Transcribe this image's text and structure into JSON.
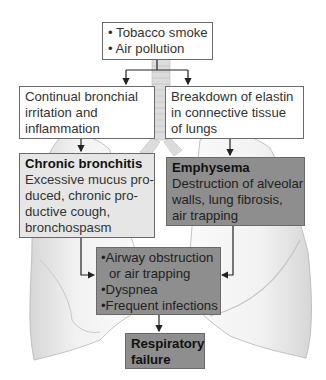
{
  "diagram": {
    "causes": {
      "items": [
        "• Tobacco smoke",
        "• Air pollution"
      ]
    },
    "left_mechanism": {
      "lines": [
        "Continual bronchial",
        "irritation and",
        "inflammation"
      ]
    },
    "right_mechanism": {
      "lines": [
        "Breakdown of elastin",
        "in connective tissue",
        "of lungs"
      ]
    },
    "chronic_bronchitis": {
      "title": "Chronic bronchitis",
      "lines": [
        "Excessive mucus pro-",
        "duced, chronic pro-",
        "ductive cough,",
        "bronchospasm"
      ]
    },
    "emphysema": {
      "title": "Emphysema",
      "lines": [
        "Destruction of alveolar",
        "walls, lung fibrosis,",
        "air trapping"
      ]
    },
    "consequences": {
      "lines": [
        "•Airway obstruction",
        "or air trapping",
        "•Dyspnea",
        "•Frequent infections"
      ]
    },
    "outcome": {
      "lines": [
        "Respiratory",
        "failure"
      ]
    }
  },
  "colors": {
    "white_box": "#ffffff",
    "light_box": "#e6e6e6",
    "dark_box": "#8e8e8e",
    "border": "#6a6a6a",
    "arrow": "#222222"
  }
}
